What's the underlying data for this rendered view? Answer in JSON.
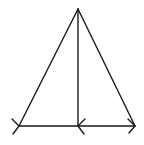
{
  "diagram": {
    "type": "isosceles-triangle-with-altitude",
    "stroke_color": "#1a1a1a",
    "background": "#ffffff",
    "points": {
      "apex": [
        78,
        9
      ],
      "base_left": [
        19,
        126
      ],
      "base_mid": [
        78,
        126
      ],
      "base_right": [
        135,
        126
      ]
    },
    "segments": [
      {
        "name": "left-side",
        "from": "apex",
        "to": "base_left"
      },
      {
        "name": "right-side",
        "from": "apex",
        "to": "base_right"
      },
      {
        "name": "altitude",
        "from": "apex",
        "to": "base_mid"
      },
      {
        "name": "base",
        "from": "base_left",
        "to": "base_right"
      }
    ],
    "arrow_marks": [
      {
        "at": "base_left",
        "direction": "right"
      },
      {
        "at": "base_mid",
        "direction": "left"
      },
      {
        "at": "base_right",
        "direction": "right"
      }
    ]
  }
}
